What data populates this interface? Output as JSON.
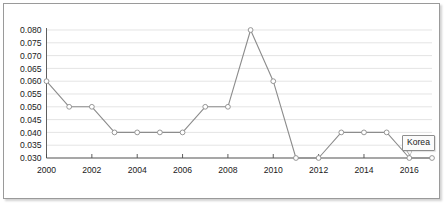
{
  "chart_data": {
    "type": "line",
    "title": "",
    "subtitle": "",
    "xlabel": "",
    "ylabel": "",
    "grid": true,
    "legend_position": "none",
    "xlim": [
      2000,
      2017
    ],
    "ylim": [
      0.03,
      0.08
    ],
    "x": [
      2000,
      2001,
      2002,
      2003,
      2004,
      2005,
      2006,
      2007,
      2008,
      2009,
      2010,
      2011,
      2012,
      2013,
      2014,
      2015,
      2016,
      2017
    ],
    "xticks": [
      "2000",
      "2002",
      "2004",
      "2006",
      "2008",
      "2010",
      "2012",
      "2014",
      "2016"
    ],
    "xtick_values": [
      2000,
      2002,
      2004,
      2006,
      2008,
      2010,
      2012,
      2014,
      2016
    ],
    "yticks": [
      "0.030",
      "0.035",
      "0.040",
      "0.045",
      "0.050",
      "0.055",
      "0.060",
      "0.065",
      "0.070",
      "0.075",
      "0.080"
    ],
    "ytick_values": [
      0.03,
      0.035,
      0.04,
      0.045,
      0.05,
      0.055,
      0.06,
      0.065,
      0.07,
      0.075,
      0.08
    ],
    "series": [
      {
        "name": "Korea",
        "values": [
          0.06,
          0.05,
          0.05,
          0.04,
          0.04,
          0.04,
          0.04,
          0.05,
          0.05,
          0.08,
          0.06,
          0.03,
          0.03,
          0.04,
          0.04,
          0.04,
          0.03,
          0.03
        ],
        "color": "#8c8c8c",
        "marker": "open-circle"
      }
    ],
    "annotations": [
      {
        "text": "Korea",
        "target_x": 2017,
        "target_y": 0.03
      }
    ]
  },
  "callout": {
    "label": "Korea"
  }
}
